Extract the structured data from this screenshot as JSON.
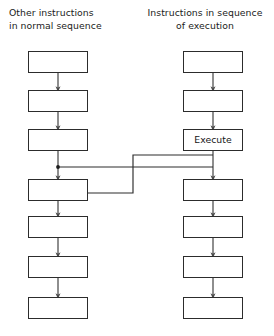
{
  "diagram": {
    "type": "flow-diagram",
    "background_color": "#ffffff",
    "line_color": "#2c2c2c",
    "text_color": "#1b1b1b",
    "columns": [
      {
        "id": "left",
        "header": "Other instructions\nin normal sequence",
        "header_align": "left",
        "box_count": 7,
        "boxes": [
          {
            "label": "",
            "name": "left-box-1"
          },
          {
            "label": "",
            "name": "left-box-2"
          },
          {
            "label": "",
            "name": "left-box-3"
          },
          {
            "label": "",
            "name": "left-box-4"
          },
          {
            "label": "",
            "name": "left-box-5"
          },
          {
            "label": "",
            "name": "left-box-6"
          },
          {
            "label": "",
            "name": "left-box-7"
          }
        ]
      },
      {
        "id": "right",
        "header": "Instructions in sequence\nof execution",
        "header_align": "center",
        "box_count": 7,
        "boxes": [
          {
            "label": "",
            "name": "right-box-1"
          },
          {
            "label": "",
            "name": "right-box-2"
          },
          {
            "label": "Execute",
            "name": "right-box-execute"
          },
          {
            "label": "",
            "name": "right-box-4"
          },
          {
            "label": "",
            "name": "right-box-5"
          },
          {
            "label": "",
            "name": "right-box-6"
          },
          {
            "label": "",
            "name": "right-box-7"
          }
        ]
      }
    ],
    "cross_connections": [
      {
        "name": "branch-to-execute",
        "from": "left-box-3",
        "to": "right-box-4",
        "description": "Branch from left sequence junction across to right column"
      },
      {
        "name": "return-from-execute",
        "from": "right-box-execute",
        "to": "left-box-4",
        "description": "Return path from Execute back into left sequence junction"
      }
    ]
  }
}
